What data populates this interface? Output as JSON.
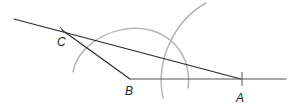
{
  "diagram": {
    "type": "geometric-construction",
    "points": {
      "A": {
        "label": "A",
        "x": 241,
        "y": 79
      },
      "B": {
        "label": "B",
        "x": 130,
        "y": 79
      },
      "C": {
        "label": "C",
        "x": 62,
        "y": 30
      }
    },
    "labels": {
      "A": "A",
      "B": "B",
      "C": "C"
    },
    "colors": {
      "line": "#2a2a2a",
      "arc": "#b5b5b5",
      "label": "#222222",
      "background": "#ffffff"
    }
  }
}
